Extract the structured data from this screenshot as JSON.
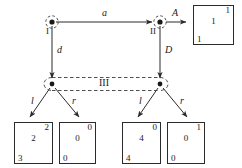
{
  "diagram": {
    "type": "extensive-form-game-tree",
    "nodes": [
      {
        "id": "I",
        "label": "I",
        "x": 52,
        "y": 22,
        "decision": true
      },
      {
        "id": "II",
        "label": "II",
        "x": 160,
        "y": 22,
        "decision": true
      },
      {
        "id": "L3",
        "label": "",
        "x": 52,
        "y": 84,
        "decision": true
      },
      {
        "id": "R3",
        "label": "",
        "x": 160,
        "y": 84,
        "decision": true
      }
    ],
    "edges": [
      {
        "id": "a",
        "label": "a",
        "from": "I",
        "to": "II"
      },
      {
        "id": "A",
        "label": "A",
        "from": "II",
        "to": "box1"
      },
      {
        "id": "d",
        "label": "d",
        "from": "I",
        "to": "L3"
      },
      {
        "id": "D",
        "label": "D",
        "from": "II",
        "to": "R3"
      },
      {
        "id": "l1",
        "label": "l",
        "from": "L3",
        "to": "box2"
      },
      {
        "id": "r1",
        "label": "r",
        "from": "L3",
        "to": "box3"
      },
      {
        "id": "l2",
        "label": "l",
        "from": "R3",
        "to": "box4"
      },
      {
        "id": "r2",
        "label": "r",
        "from": "R3",
        "to": "box5"
      }
    ],
    "information_sets": [
      {
        "id": "III",
        "label": "III",
        "members": [
          "L3",
          "R3"
        ],
        "style": "dashed-oval"
      }
    ],
    "payoff_boxes": [
      {
        "id": "box1",
        "top_right": "1",
        "center": "1",
        "bottom_left": "1"
      },
      {
        "id": "box2",
        "top_right": "2",
        "center": "2",
        "bottom_left": "3"
      },
      {
        "id": "box3",
        "top_right": "0",
        "center": "0",
        "bottom_left": "0"
      },
      {
        "id": "box4",
        "top_right": "0",
        "center": "4",
        "bottom_left": "4"
      },
      {
        "id": "box5",
        "top_right": "1",
        "center": "0",
        "bottom_left": "0"
      }
    ],
    "colors": {
      "stroke": "#2b2b2b",
      "text": "#1a1a1a",
      "background": "#ffffff",
      "dashed": "#555555"
    }
  }
}
